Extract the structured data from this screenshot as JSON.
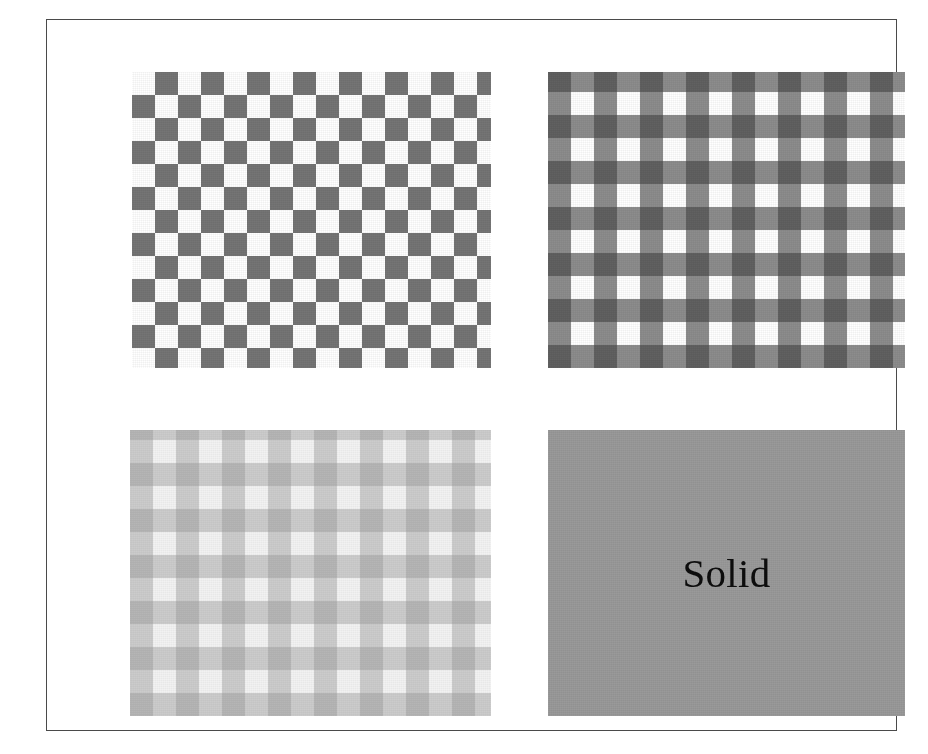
{
  "figure": {
    "background_color": "#ffffff",
    "frame": {
      "border_color": "#4a4a4a",
      "fill_color": "#ffffff"
    },
    "panels": [
      {
        "id": "checkerboard",
        "name": "sparse-checkerboard-swatch",
        "position": "top-left",
        "pattern_type": "checkerboard",
        "label": "",
        "cell_size_px": 23,
        "columns": 16,
        "rows": 13,
        "colors": {
          "dark": "#757575",
          "light": "#ffffff"
        }
      },
      {
        "id": "gingham",
        "name": "dense-gingham-swatch",
        "position": "top-right",
        "pattern_type": "gingham",
        "label": "",
        "cell_size_px": 23,
        "columns": 16,
        "rows": 13,
        "colors": {
          "dark": "#4f4f4f",
          "medium": "#8a8a8a",
          "light": "#ffffff"
        }
      },
      {
        "id": "faint",
        "name": "low-contrast-gingham-swatch",
        "position": "bottom-left",
        "pattern_type": "gingham",
        "label": "",
        "cell_size_px": 23,
        "columns": 16,
        "rows": 12,
        "colors": {
          "dark": "#c9c9c9",
          "medium": "#dedede",
          "light": "#f2f2f2"
        }
      },
      {
        "id": "solid",
        "name": "solid-gray-swatch",
        "position": "bottom-right",
        "pattern_type": "solid",
        "label": "Solid",
        "colors": {
          "fill": "#9a9a9a",
          "text": "#0d0d0d"
        }
      }
    ]
  }
}
